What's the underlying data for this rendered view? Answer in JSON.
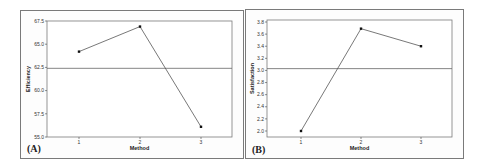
{
  "chart_data": [
    {
      "type": "line",
      "panel_label": "(A)",
      "title": "",
      "xlabel": "Method",
      "ylabel": "Efficiency",
      "categories": [
        "1",
        "2",
        "3"
      ],
      "values": [
        64.2,
        66.9,
        56.1
      ],
      "reference_line": 62.4,
      "ylim": [
        55.0,
        67.5
      ],
      "yticks": [
        "55.0",
        "57.5",
        "60.0",
        "62.5",
        "65.0",
        "67.5"
      ],
      "grid": false,
      "legend": null
    },
    {
      "type": "line",
      "panel_label": "(B)",
      "title": "",
      "xlabel": "Method",
      "ylabel": "Satisfaction",
      "categories": [
        "1",
        "2",
        "3"
      ],
      "values": [
        2.0,
        3.69,
        3.4
      ],
      "reference_line": 3.03,
      "ylim": [
        2.0,
        3.8
      ],
      "yticks": [
        "2.0",
        "2.2",
        "2.4",
        "2.6",
        "2.8",
        "3.0",
        "3.2",
        "3.4",
        "3.6",
        "3.8"
      ],
      "grid": false,
      "legend": null
    }
  ],
  "colors": {
    "line": "#555555",
    "marker": "#111111",
    "frame": "#7a7a7a",
    "reference": "#666666"
  }
}
